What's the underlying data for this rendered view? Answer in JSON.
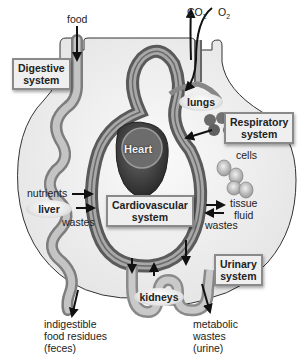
{
  "diagram": {
    "systems": {
      "digestive": "Digestive system",
      "digestive_line1": "Digestive",
      "digestive_line2": "system",
      "respiratory_line1": "Respiratory",
      "respiratory_line2": "system",
      "cardiovascular_line1": "Cardiovascular",
      "cardiovascular_line2": "system",
      "urinary_line1": "Urinary",
      "urinary_line2": "system"
    },
    "organs": {
      "heart": "Heart",
      "lungs": "lungs",
      "liver": "liver",
      "kidneys": "kidneys"
    },
    "labels": {
      "food": "food",
      "co2_base": "CO",
      "co2_sub": "2",
      "o2_base": "O",
      "o2_sub": "2",
      "cells": "cells",
      "nutrients": "nutrients",
      "wastes_left": "wastes",
      "tissue_fluid_line1": "tissue",
      "tissue_fluid_line2": "fluid",
      "wastes_right": "wastes",
      "feces_line1": "indigestible",
      "feces_line2": "food residues",
      "feces_line3": "(feces)",
      "urine_line1": "metabolic",
      "urine_line2": "wastes",
      "urine_line3": "(urine)"
    },
    "colors": {
      "body_fill": "#f2f2f2",
      "vessel_dark": "#6f6f6f",
      "vessel_light": "#b8b8b8",
      "heart": "#3d3d3d",
      "gut": "#a9a9a9",
      "box_bg": "#efefef",
      "box_border": "#8a8a8a"
    }
  }
}
